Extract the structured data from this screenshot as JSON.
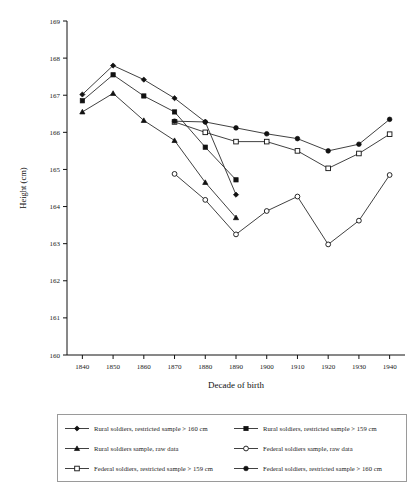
{
  "chart_data": {
    "type": "line",
    "title": "",
    "xlabel": "Decade of birth",
    "ylabel": "Height (cm)",
    "xlim": [
      1835,
      1945
    ],
    "ylim": [
      160,
      169
    ],
    "grid": false,
    "legend_position": "below-plot",
    "x_ticklabels": [
      "1840",
      "1850",
      "1860",
      "1870",
      "1880",
      "1890",
      "1900",
      "1910",
      "1920",
      "1930",
      "1940"
    ],
    "y_ticklabels": [
      "160",
      "161",
      "162",
      "163",
      "164",
      "165",
      "166",
      "167",
      "168",
      "169"
    ],
    "series": [
      {
        "name": "Rural soldiers, restricted sample > 160 cm",
        "marker": "filled-diamond",
        "x": [
          1840,
          1850,
          1860,
          1870,
          1880,
          1890
        ],
        "values": [
          167.02,
          167.8,
          167.42,
          166.92,
          166.28,
          164.32
        ]
      },
      {
        "name": "Rural soldiers, restricted sample > 159 cm",
        "marker": "filled-square",
        "x": [
          1840,
          1850,
          1860,
          1870,
          1880,
          1890
        ],
        "values": [
          166.85,
          167.55,
          166.98,
          166.55,
          165.6,
          164.72
        ]
      },
      {
        "name": "Rural soldiers sample, raw data",
        "marker": "filled-triangle",
        "x": [
          1840,
          1850,
          1860,
          1870,
          1880,
          1890
        ],
        "values": [
          166.55,
          167.05,
          166.32,
          165.78,
          164.65,
          163.7
        ]
      },
      {
        "name": "Federal soldiers sample, raw data",
        "marker": "open-circle",
        "x": [
          1870,
          1880,
          1890,
          1900,
          1910,
          1920,
          1930,
          1940
        ],
        "values": [
          164.88,
          164.18,
          163.25,
          163.88,
          164.27,
          162.98,
          163.62,
          164.85
        ]
      },
      {
        "name": "Federal soldiers, restricted sample > 159 cm",
        "marker": "open-square",
        "x": [
          1870,
          1880,
          1890,
          1900,
          1910,
          1920,
          1930,
          1940
        ],
        "values": [
          166.28,
          166.0,
          165.75,
          165.75,
          165.5,
          165.03,
          165.43,
          165.95
        ]
      },
      {
        "name": "Federal soldiers, restricted sample > 160 cm",
        "marker": "filled-circle",
        "x": [
          1870,
          1880,
          1890,
          1900,
          1910,
          1920,
          1930,
          1940
        ],
        "values": [
          166.3,
          166.28,
          166.12,
          165.96,
          165.83,
          165.5,
          165.68,
          166.35
        ]
      }
    ]
  },
  "axes": {
    "ylabel": "Height (cm)",
    "xlabel": "Decade of birth"
  },
  "legend": {
    "items": [
      {
        "label": "Rural soldiers, restricted sample > 160 cm",
        "marker": "filled-diamond"
      },
      {
        "label": "Rural soldiers, restricted sample > 159 cm",
        "marker": "filled-square"
      },
      {
        "label": "Rural soldiers sample, raw data",
        "marker": "filled-triangle"
      },
      {
        "label": "Federal soldiers sample, raw data",
        "marker": "open-circle"
      },
      {
        "label": "Federal soldiers, restricted sample > 159 cm",
        "marker": "open-square"
      },
      {
        "label": "Federal soldiers, restricted sample > 160 cm",
        "marker": "filled-circle"
      }
    ]
  }
}
